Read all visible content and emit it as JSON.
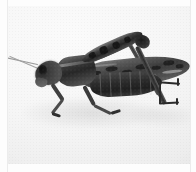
{
  "image": {
    "subject": "grasshopper",
    "alt_text": "Black and white photograph of a grasshopper in left-facing profile on a plain pale background",
    "medium": "black-and-white photograph",
    "orientation": "profile, facing left",
    "background_description": "plain pale off-white surface",
    "colors": {
      "page": "#fdfdfd",
      "photo_background_light": "#fbfbfb",
      "photo_background_shade": "#e7e7e7",
      "body_dark": "#1f1f1f",
      "body_mid": "#4a4a4a",
      "body_light": "#8d8d8d",
      "rule_line": "#ececec"
    },
    "frame": {
      "width": 196,
      "height": 172,
      "photo_left": 8,
      "photo_top": 6,
      "photo_width": 182,
      "photo_height": 158
    }
  },
  "anatomy": {
    "parts": [
      {
        "id": "antenna-upper",
        "label": "upper antenna"
      },
      {
        "id": "antenna-lower",
        "label": "lower antenna"
      },
      {
        "id": "head",
        "label": "head"
      },
      {
        "id": "eye",
        "label": "compound eye"
      },
      {
        "id": "mouthparts",
        "label": "mouthparts"
      },
      {
        "id": "pronotum",
        "label": "pronotum"
      },
      {
        "id": "thorax",
        "label": "thorax"
      },
      {
        "id": "abdomen",
        "label": "abdomen"
      },
      {
        "id": "forewing",
        "label": "forewing (tegmen)"
      },
      {
        "id": "hind-femur",
        "label": "hind femur"
      },
      {
        "id": "hind-knee",
        "label": "hind knee"
      },
      {
        "id": "hind-tibia",
        "label": "hind tibia"
      },
      {
        "id": "hind-tarsus",
        "label": "hind tarsus"
      },
      {
        "id": "foreleg",
        "label": "foreleg"
      },
      {
        "id": "midleg",
        "label": "midleg"
      },
      {
        "id": "shadow",
        "label": "cast shadow"
      }
    ]
  }
}
